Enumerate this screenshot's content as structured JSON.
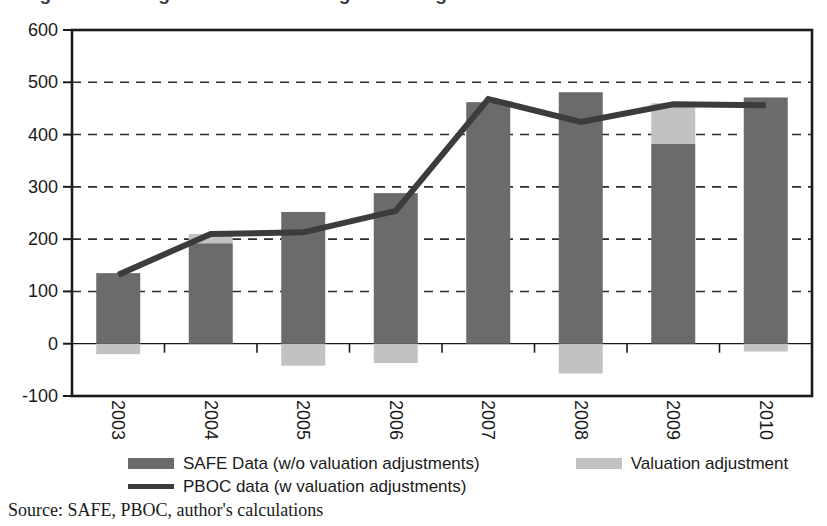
{
  "figure": {
    "title_remnant": "Figure 3. Changes in China's foreign exchange reserves",
    "source_note": "Source: SAFE, PBOC, author's calculations"
  },
  "colors": {
    "bar_dark": "#6b6b6b",
    "bar_light": "#c2c2c2",
    "line": "#3c3c3c",
    "axis": "#1a1a1a",
    "grid": "#2b2b2b",
    "background": "#ffffff"
  },
  "legend": {
    "position": "below-axis",
    "entries": [
      {
        "label": "SAFE Data (w/o valuation adjustments)",
        "marker": "box",
        "color": "#6b6b6b"
      },
      {
        "label": "Valuation adjustment",
        "marker": "box",
        "color": "#c2c2c2"
      },
      {
        "label": "PBOC data (w valuation adjustments)",
        "marker": "line",
        "color": "#3c3c3c"
      }
    ]
  },
  "chart_data": {
    "type": "bar",
    "title": "",
    "xlabel": "",
    "ylabel": "",
    "categories": [
      "2003",
      "2004",
      "2005",
      "2006",
      "2007",
      "2008",
      "2009",
      "2010"
    ],
    "ylim": [
      -100,
      600
    ],
    "yticks": [
      -100,
      0,
      100,
      200,
      300,
      400,
      500,
      600
    ],
    "ytick_labels": [
      "-100",
      "0",
      "100",
      "200",
      "300",
      "400",
      "500",
      "600"
    ],
    "grid": true,
    "grid_style": "dashed-horizontal",
    "legend_position": "bottom",
    "series": [
      {
        "name": "SAFE Data (w/o valuation adjustments)",
        "type": "bar",
        "color": "#6b6b6b",
        "values": [
          135,
          192,
          252,
          288,
          462,
          481,
          382,
          471
        ]
      },
      {
        "name": "Valuation adjustment",
        "type": "bar",
        "color": "#c2c2c2",
        "stacked": true,
        "values": [
          -20,
          18,
          -42,
          -37,
          0,
          -57,
          78,
          -15
        ]
      },
      {
        "name": "PBOC data (w valuation adjustments)",
        "type": "line",
        "color": "#3c3c3c",
        "values": [
          132,
          210,
          213,
          254,
          468,
          424,
          458,
          456
        ]
      }
    ]
  }
}
